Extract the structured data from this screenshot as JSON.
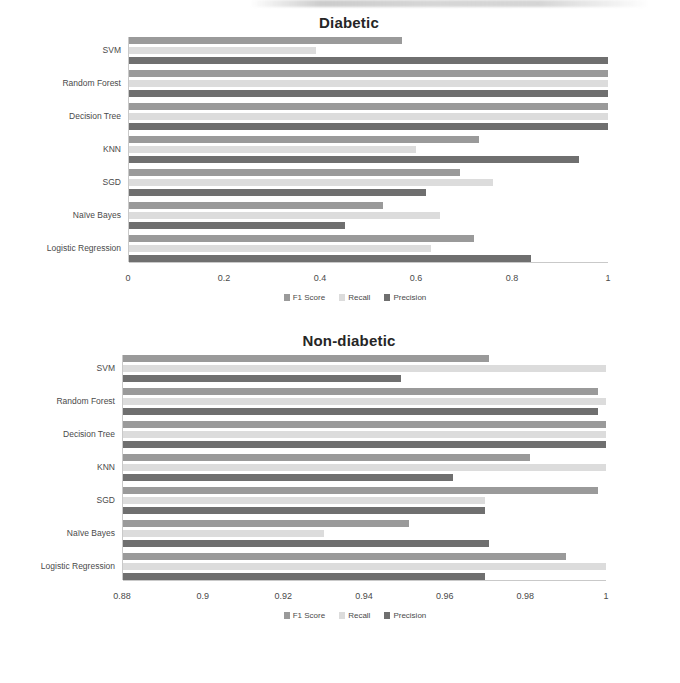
{
  "charts": [
    {
      "id": "diabetic",
      "title": "Diabetic",
      "xlim": [
        0,
        1
      ],
      "ticks": [
        "0",
        "0.2",
        "0.4",
        "0.6",
        "0.8",
        "1"
      ],
      "tick_values": [
        0,
        0.2,
        0.4,
        0.6,
        0.8,
        1
      ],
      "categories": [
        "SVM",
        "Random Forest",
        "Decision Tree",
        "KNN",
        "SGD",
        "Naïve Bayes",
        "Logistic Regression"
      ],
      "legend": [
        "F1 Score",
        "Recall",
        "Precision"
      ]
    },
    {
      "id": "nondiabetic",
      "title": "Non-diabetic",
      "xlim": [
        0.88,
        1
      ],
      "ticks": [
        "0.88",
        "0.9",
        "0.92",
        "0.94",
        "0.96",
        "0.98",
        "1"
      ],
      "tick_values": [
        0.88,
        0.9,
        0.92,
        0.94,
        0.96,
        0.98,
        1
      ],
      "categories": [
        "SVM",
        "Random Forest",
        "Decision Tree",
        "KNN",
        "SGD",
        "Naïve Bayes",
        "Logistic Regression"
      ],
      "legend": [
        "F1 Score",
        "Recall",
        "Precision"
      ]
    }
  ],
  "colors": {
    "f1": "#9a9a9a",
    "recall": "#dcdcdc",
    "precision": "#6f6f6f",
    "axis": "#c9c9c9",
    "text": "#4a4a4a",
    "title": "#262626"
  },
  "chart_data": [
    {
      "type": "bar",
      "orientation": "horizontal",
      "title": "Diabetic",
      "xlabel": "",
      "ylabel": "",
      "xlim": [
        0,
        1
      ],
      "grid": false,
      "legend_position": "bottom",
      "categories": [
        "SVM",
        "Random Forest",
        "Decision Tree",
        "KNN",
        "SGD",
        "Naïve Bayes",
        "Logistic Regression"
      ],
      "tick_labels": [
        "0",
        "0.2",
        "0.4",
        "0.6",
        "0.8",
        "1"
      ],
      "series": [
        {
          "name": "F1 Score",
          "values": [
            0.57,
            1.0,
            1.0,
            0.73,
            0.69,
            0.53,
            0.72
          ]
        },
        {
          "name": "Recall",
          "values": [
            0.39,
            1.0,
            1.0,
            0.6,
            0.76,
            0.65,
            0.63
          ]
        },
        {
          "name": "Precision",
          "values": [
            1.0,
            1.0,
            1.0,
            0.94,
            0.62,
            0.45,
            0.84
          ]
        }
      ]
    },
    {
      "type": "bar",
      "orientation": "horizontal",
      "title": "Non-diabetic",
      "xlabel": "",
      "ylabel": "",
      "xlim": [
        0.88,
        1
      ],
      "grid": false,
      "legend_position": "bottom",
      "categories": [
        "SVM",
        "Random Forest",
        "Decision Tree",
        "KNN",
        "SGD",
        "Naïve Bayes",
        "Logistic Regression"
      ],
      "tick_labels": [
        "0.88",
        "0.9",
        "0.92",
        "0.94",
        "0.96",
        "0.98",
        "1"
      ],
      "series": [
        {
          "name": "F1 Score",
          "values": [
            0.971,
            0.998,
            1.0,
            0.981,
            0.998,
            0.951,
            0.99
          ]
        },
        {
          "name": "Recall",
          "values": [
            1.0,
            1.0,
            1.0,
            1.0,
            0.97,
            0.93,
            1.0
          ]
        },
        {
          "name": "Precision",
          "values": [
            0.949,
            0.998,
            1.0,
            0.962,
            0.97,
            0.971,
            0.97
          ]
        }
      ]
    }
  ]
}
